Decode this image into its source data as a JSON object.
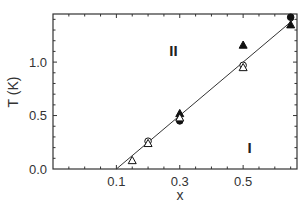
{
  "chart_data": {
    "type": "scatter",
    "title": "",
    "xlabel": "x",
    "ylabel": "T (K)",
    "xlim": [
      -0.1,
      0.67
    ],
    "ylim": [
      0.0,
      1.45
    ],
    "x_ticks": [
      0.1,
      0.3,
      0.5
    ],
    "x_tick_labels": [
      "0.1",
      "0.3",
      "0.5"
    ],
    "y_ticks": [
      0.0,
      0.5,
      1.0
    ],
    "y_tick_labels": [
      "0.0",
      "0.5",
      "1.0"
    ],
    "grid": false,
    "legend": null,
    "series": [
      {
        "name": "filled circles",
        "marker": "filled-circle",
        "points": [
          [
            0.3,
            0.45
          ],
          [
            0.65,
            1.42
          ]
        ]
      },
      {
        "name": "filled triangles",
        "marker": "filled-triangle",
        "points": [
          [
            0.3,
            0.52
          ],
          [
            0.5,
            1.16
          ],
          [
            0.65,
            1.35
          ]
        ]
      },
      {
        "name": "open circles",
        "marker": "open-circle",
        "points": [
          [
            0.2,
            0.26
          ],
          [
            0.5,
            0.97
          ]
        ]
      },
      {
        "name": "open triangles",
        "marker": "open-triangle",
        "points": [
          [
            0.15,
            0.08
          ],
          [
            0.2,
            0.24
          ],
          [
            0.3,
            0.48
          ],
          [
            0.5,
            0.95
          ]
        ]
      }
    ],
    "fit_line": {
      "x": [
        0.1,
        0.66
      ],
      "y": [
        0.0,
        1.4
      ]
    },
    "annotations": [
      {
        "text": "II",
        "x": 0.28,
        "y": 1.1
      },
      {
        "text": "I",
        "x": 0.52,
        "y": 0.2
      }
    ]
  }
}
